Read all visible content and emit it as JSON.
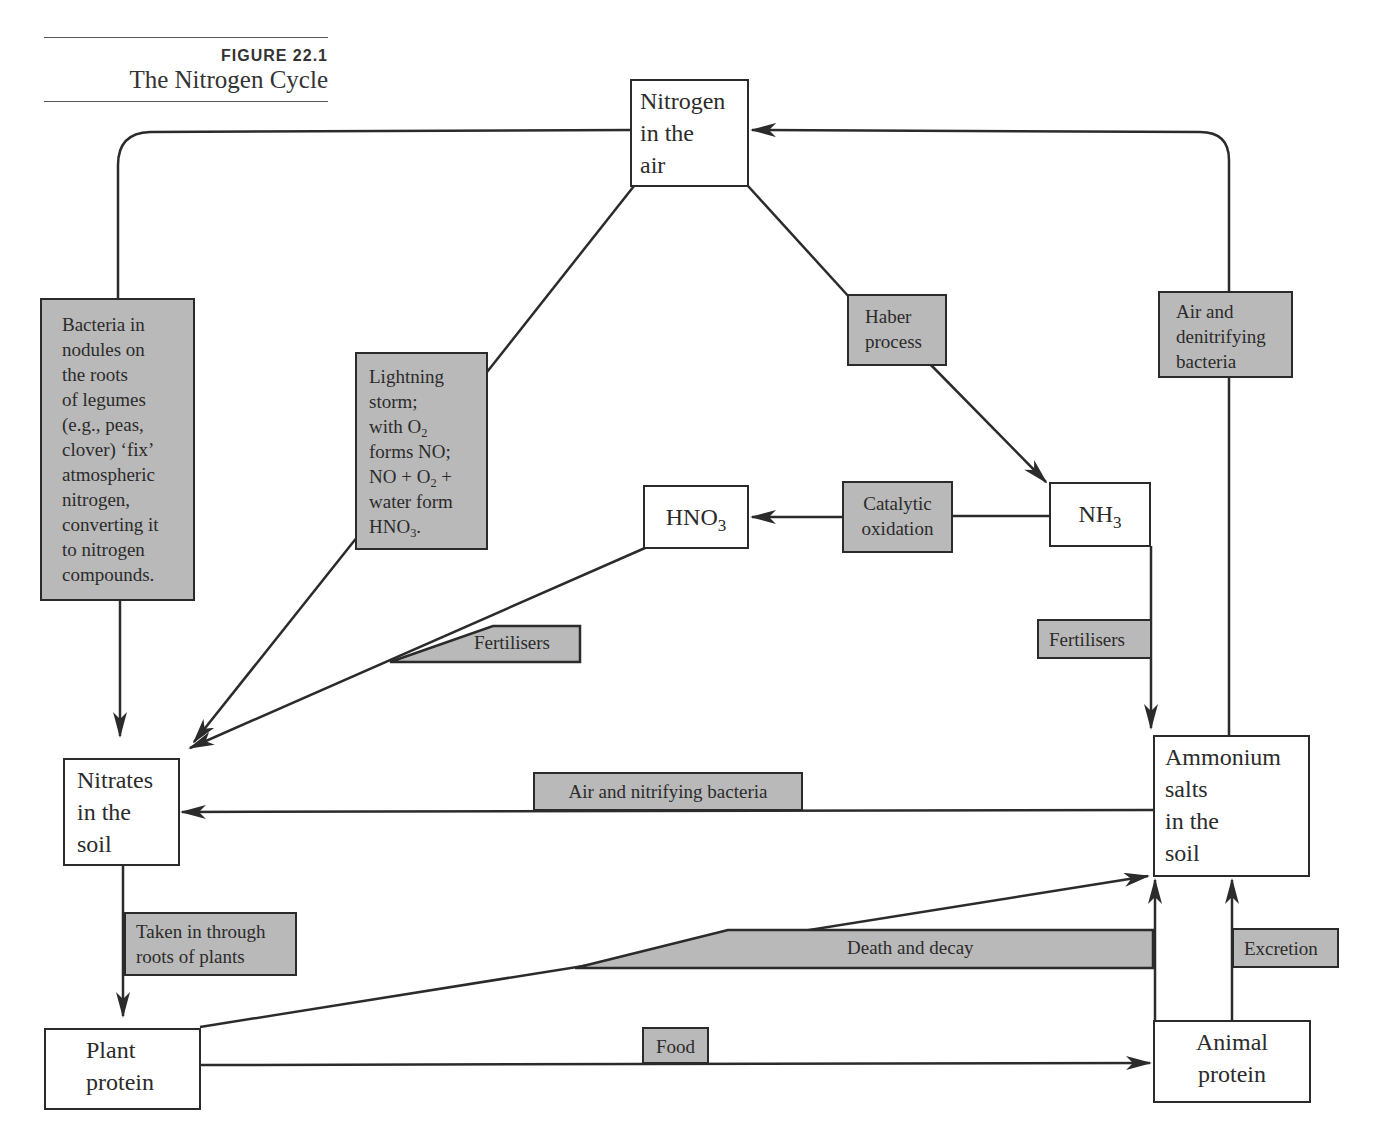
{
  "caption": {
    "figure_number": "FIGURE 22.1",
    "title": "The Nitrogen Cycle"
  },
  "nodes": {
    "nitrogen_air": "Nitrogen\nin the\nair",
    "hno3_base": "HNO",
    "hno3_sub": "3",
    "nh3_base": "NH",
    "nh3_sub": "3",
    "nitrates_soil": "Nitrates\nin the\nsoil",
    "ammonium_soil": "Ammonium\nsalts\nin the\nsoil",
    "plant_protein": "Plant\nprotein",
    "animal_protein": "Animal\nprotein"
  },
  "process_labels": {
    "bacteria_legumes": "Bacteria in\nnodules on\nthe roots\nof legumes\n(e.g., peas,\nclover) ‘fix’\natmospheric\nnitrogen,\nconverting it\nto nitrogen\ncompounds.",
    "lightning": {
      "line1": "Lightning",
      "line2": "storm;",
      "line3_pre": "with O",
      "line3_sub": "2",
      "line4": "forms NO;",
      "line5_pre": "NO + O",
      "line5_sub": "2",
      "line5_post": " +",
      "line6": "water form",
      "line7_pre": "HNO",
      "line7_sub": "3",
      "line7_post": "."
    },
    "haber": "Haber\nprocess",
    "denitrifying": "Air and\ndenitrifying\nbacteria",
    "catalytic": "Catalytic\noxidation",
    "fertilisers_left": "Fertilisers",
    "fertilisers_right": "Fertilisers",
    "nitrifying": "Air and nitrifying bacteria",
    "roots_plants": "Taken in through\nroots of plants",
    "death_decay": "Death and decay",
    "excretion": "Excretion",
    "food": "Food"
  },
  "colors": {
    "line": "#2b2b2b",
    "label_fill": "#b9b9b9",
    "node_fill": "#ffffff"
  }
}
